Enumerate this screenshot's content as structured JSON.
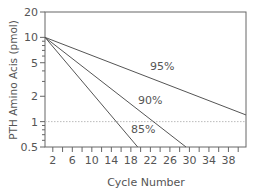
{
  "chart_data": {
    "type": "line",
    "title": "",
    "xlabel": "Cycle Number",
    "ylabel": "PTH Amino Acis (pmol)",
    "yscale": "log",
    "ylim": [
      0.5,
      20
    ],
    "xlim": [
      0.4,
      41.6
    ],
    "grid": false,
    "legend": "inline labels",
    "xticks": [
      2,
      6,
      10,
      14,
      18,
      22,
      26,
      30,
      34,
      38
    ],
    "yticks": [
      {
        "value": 20,
        "label": "20"
      },
      {
        "value": 10,
        "label": "10"
      },
      {
        "value": 5,
        "label": "5"
      },
      {
        "value": 2,
        "label": "2"
      },
      {
        "value": 1,
        "label": "1"
      },
      {
        "value": 0.5,
        "label": "0.5"
      }
    ],
    "reference_line": {
      "y": 1,
      "style": "dotted"
    },
    "series": [
      {
        "name": "95%",
        "label": "95%",
        "start": {
          "x": 0.4,
          "y": 10
        },
        "end": {
          "x": 41.6,
          "y": 1.2
        }
      },
      {
        "name": "90%",
        "label": "90%",
        "start": {
          "x": 0.4,
          "y": 10
        },
        "end": {
          "x": 29.3,
          "y": 0.5
        }
      },
      {
        "name": "85%",
        "label": "85%",
        "start": {
          "x": 0.4,
          "y": 10
        },
        "end": {
          "x": 19.4,
          "y": 0.5
        }
      }
    ]
  }
}
